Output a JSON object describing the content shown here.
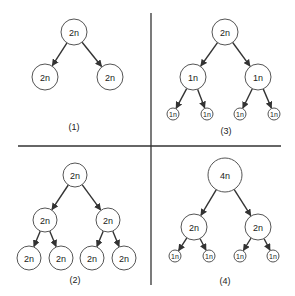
{
  "diagram": {
    "colors": {
      "node_stroke": "#555555",
      "edge": "#333333",
      "text": "#222222",
      "background": "#ffffff"
    },
    "dividers": {
      "horizontal": {
        "x1": 18,
        "y": 146,
        "x2": 281
      },
      "vertical": {
        "x": 151,
        "y1": 13,
        "y2": 285
      }
    },
    "panels": [
      {
        "id": "panel-1",
        "caption": "(1)",
        "caption_pos": [
          74,
          127
        ],
        "nodes": [
          {
            "id": "p1-root",
            "label": "2n",
            "x": 74,
            "y": 32,
            "r": 13,
            "fs": 9
          },
          {
            "id": "p1-left",
            "label": "2n",
            "x": 45,
            "y": 77,
            "r": 13,
            "fs": 9
          },
          {
            "id": "p1-right",
            "label": "2n",
            "x": 110,
            "y": 77,
            "r": 13,
            "fs": 9
          }
        ],
        "edges": [
          [
            "p1-root",
            "p1-left"
          ],
          [
            "p1-root",
            "p1-right"
          ]
        ]
      },
      {
        "id": "panel-3",
        "caption": "(3)",
        "caption_pos": [
          226,
          131
        ],
        "nodes": [
          {
            "id": "p3-root",
            "label": "2n",
            "x": 225,
            "y": 32,
            "r": 13,
            "fs": 9
          },
          {
            "id": "p3-l",
            "label": "1n",
            "x": 193,
            "y": 77,
            "r": 13,
            "fs": 9
          },
          {
            "id": "p3-r",
            "label": "1n",
            "x": 258,
            "y": 77,
            "r": 13,
            "fs": 9
          },
          {
            "id": "p3-ll",
            "label": "1n",
            "x": 173,
            "y": 114,
            "r": 6,
            "fs": 7
          },
          {
            "id": "p3-lr",
            "label": "1n",
            "x": 207,
            "y": 114,
            "r": 6,
            "fs": 7
          },
          {
            "id": "p3-rl",
            "label": "1n",
            "x": 240,
            "y": 114,
            "r": 6,
            "fs": 7
          },
          {
            "id": "p3-rr",
            "label": "1n",
            "x": 274,
            "y": 114,
            "r": 6,
            "fs": 7
          }
        ],
        "edges": [
          [
            "p3-root",
            "p3-l"
          ],
          [
            "p3-root",
            "p3-r"
          ],
          [
            "p3-l",
            "p3-ll"
          ],
          [
            "p3-l",
            "p3-lr"
          ],
          [
            "p3-r",
            "p3-rl"
          ],
          [
            "p3-r",
            "p3-rr"
          ]
        ]
      },
      {
        "id": "panel-2",
        "caption": "(2)",
        "caption_pos": [
          75,
          280
        ],
        "nodes": [
          {
            "id": "p2-root",
            "label": "2n",
            "x": 75,
            "y": 175,
            "r": 12,
            "fs": 9
          },
          {
            "id": "p2-l",
            "label": "2n",
            "x": 45,
            "y": 220,
            "r": 12,
            "fs": 9
          },
          {
            "id": "p2-r",
            "label": "2n",
            "x": 108,
            "y": 220,
            "r": 12,
            "fs": 9
          },
          {
            "id": "p2-ll",
            "label": "2n",
            "x": 29,
            "y": 258,
            "r": 12,
            "fs": 9
          },
          {
            "id": "p2-lr",
            "label": "2n",
            "x": 61,
            "y": 258,
            "r": 12,
            "fs": 9
          },
          {
            "id": "p2-rl",
            "label": "2n",
            "x": 92,
            "y": 258,
            "r": 12,
            "fs": 9
          },
          {
            "id": "p2-rr",
            "label": "2n",
            "x": 124,
            "y": 258,
            "r": 12,
            "fs": 9
          }
        ],
        "edges": [
          [
            "p2-root",
            "p2-l"
          ],
          [
            "p2-root",
            "p2-r"
          ],
          [
            "p2-l",
            "p2-ll"
          ],
          [
            "p2-l",
            "p2-lr"
          ],
          [
            "p2-r",
            "p2-rl"
          ],
          [
            "p2-r",
            "p2-rr"
          ]
        ]
      },
      {
        "id": "panel-4",
        "caption": "(4)",
        "caption_pos": [
          225,
          281
        ],
        "nodes": [
          {
            "id": "p4-root",
            "label": "4n",
            "x": 225,
            "y": 175,
            "r": 17,
            "fs": 9
          },
          {
            "id": "p4-l",
            "label": "2n",
            "x": 194,
            "y": 227,
            "r": 13,
            "fs": 9
          },
          {
            "id": "p4-r",
            "label": "2n",
            "x": 258,
            "y": 227,
            "r": 13,
            "fs": 9
          },
          {
            "id": "p4-ll",
            "label": "1n",
            "x": 175,
            "y": 256,
            "r": 6,
            "fs": 7
          },
          {
            "id": "p4-lr",
            "label": "1n",
            "x": 209,
            "y": 256,
            "r": 6,
            "fs": 7
          },
          {
            "id": "p4-rl",
            "label": "1n",
            "x": 240,
            "y": 256,
            "r": 6,
            "fs": 7
          },
          {
            "id": "p4-rr",
            "label": "1n",
            "x": 273,
            "y": 256,
            "r": 6,
            "fs": 7
          }
        ],
        "edges": [
          [
            "p4-root",
            "p4-l"
          ],
          [
            "p4-root",
            "p4-r"
          ],
          [
            "p4-l",
            "p4-ll"
          ],
          [
            "p4-l",
            "p4-lr"
          ],
          [
            "p4-r",
            "p4-rl"
          ],
          [
            "p4-r",
            "p4-rr"
          ]
        ]
      }
    ]
  }
}
